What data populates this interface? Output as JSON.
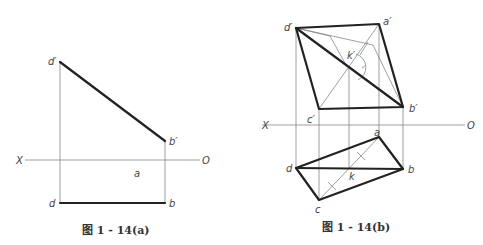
{
  "figures": [
    {
      "id": "a",
      "caption": "图 1 - 14(a)",
      "axis": {
        "left_label": "X",
        "right_label": "O"
      },
      "points": {
        "d_prime": "d′",
        "b_prime": "b′",
        "a": "a",
        "d": "d",
        "b": "b"
      }
    },
    {
      "id": "b",
      "caption": "图 1 - 14(b)",
      "axis": {
        "left_label": "X",
        "right_label": "O"
      },
      "points": {
        "d_prime": "d′",
        "a_prime": "a′",
        "b_prime": "b′",
        "c_prime": "c′",
        "k_prime": "k′",
        "a": "a",
        "b": "b",
        "c": "c",
        "d": "d",
        "k": "k"
      }
    }
  ]
}
